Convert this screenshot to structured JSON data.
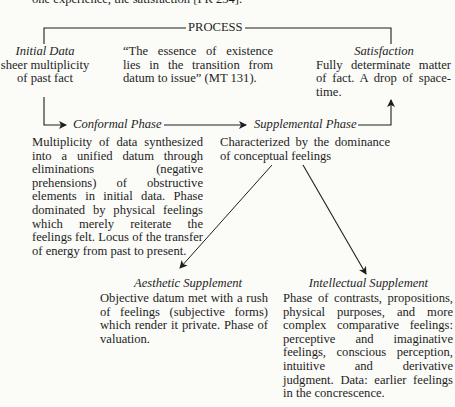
{
  "top_fragment": "one experience, the satisfaction [PR 234].",
  "process_label": "PROCESS",
  "initial_data": {
    "title": "Initial Data",
    "lines": [
      "sheer multiplicity",
      "of past fact"
    ]
  },
  "quote": {
    "text": "“The essence of existence lies in the transition from datum to issue” (MT 131)."
  },
  "satisfaction": {
    "title": "Satisfaction",
    "text": "Fully determinate matter of fact. A drop of space-time."
  },
  "conformal_phase": {
    "title": "Conformal Phase",
    "text": "Multiplicity of data synthesized into a unified datum through eliminations (negative prehensions) of obstructive elements in initial data. Phase dominated by physical feelings which merely reiterate the feelings felt. Locus of the transfer of energy from past to present."
  },
  "supplemental_phase": {
    "title": "Supplemental Phase",
    "text": "Characterized by the dominance of conceptual feelings"
  },
  "aesthetic_supplement": {
    "title": "Aesthetic Supplement",
    "text": "Objective datum met with a rush of feelings (subjective forms) which render it private. Phase of valuation."
  },
  "intellectual_supplement": {
    "title": "Intellectual Supplement",
    "text": "Phase of contrasts, propositions, physical purposes, and more complex comparative feelings: perceptive and imaginative feelings, conscious perception, intuitive and derivative judgment. Data: earlier feelings in the concrescence."
  },
  "colors": {
    "ink": "#1e1e1e",
    "paper": "#fbfbf8"
  }
}
